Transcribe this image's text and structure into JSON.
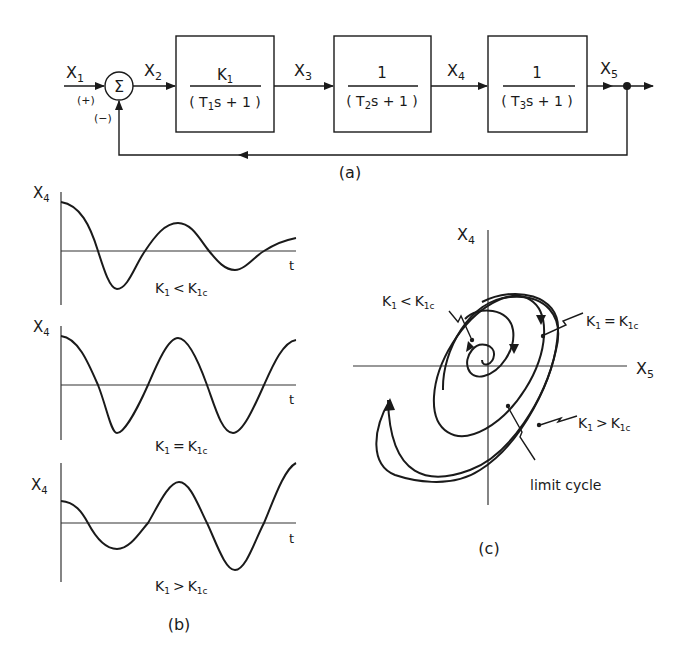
{
  "block_diagram": {
    "caption": "(a)",
    "signals": {
      "x1": "X",
      "x1_sub": "1",
      "x2": "X",
      "x2_sub": "2",
      "x3": "X",
      "x3_sub": "3",
      "x4": "X",
      "x4_sub": "4",
      "x5": "X",
      "x5_sub": "5"
    },
    "summer": {
      "symbol": "Σ",
      "plus": "(+)",
      "minus": "(−)"
    },
    "blocks": [
      {
        "num": "K",
        "num_sub": "1",
        "den_pre": "( T",
        "den_sub": "1",
        "den_post": "s + 1 )"
      },
      {
        "num": "1",
        "num_sub": "",
        "den_pre": "( T",
        "den_sub": "2",
        "den_post": "s + 1 )"
      },
      {
        "num": "1",
        "num_sub": "",
        "den_pre": "( T",
        "den_sub": "3",
        "den_post": "s + 1 )"
      }
    ]
  },
  "time_responses": {
    "caption": "(b)",
    "ylabel": "X",
    "ylabel_sub": "4",
    "xlabel": "t",
    "panels": [
      {
        "condition_a": "K",
        "a_sub": "1",
        "rel": "<",
        "condition_b": "K",
        "b_sub": "1c"
      },
      {
        "condition_a": "K",
        "a_sub": "1",
        "rel": "=",
        "condition_b": "K",
        "b_sub": "1c"
      },
      {
        "condition_a": "K",
        "a_sub": "1",
        "rel": ">",
        "condition_b": "K",
        "b_sub": "1c"
      }
    ]
  },
  "phase_plane": {
    "caption": "(c)",
    "yaxis": "X",
    "yaxis_sub": "4",
    "xaxis": "X",
    "xaxis_sub": "5",
    "labels": {
      "lt": {
        "a": "K",
        "a_sub": "1",
        "rel": "<",
        "b": "K",
        "b_sub": "1c"
      },
      "eq": {
        "a": "K",
        "a_sub": "1",
        "rel": "=",
        "b": "K",
        "b_sub": "1c"
      },
      "gt": {
        "a": "K",
        "a_sub": "1",
        "rel": ">",
        "b": "K",
        "b_sub": "1c"
      },
      "limit": "limit cycle"
    }
  }
}
